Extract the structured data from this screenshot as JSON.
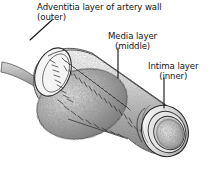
{
  "figure": {
    "style": "black-and-white stippled line drawing",
    "colors": {
      "background": "#ffffff",
      "ink": "#151515",
      "outline": "#2a2a2a",
      "shading_dark": "#6f6f6f",
      "shading_mid": "#9a9a9a",
      "shading_light": "#cfcfcf"
    },
    "labels": [
      {
        "id": "adventitia",
        "line1": "Adventitia layer of artery wall",
        "line2": "(outer)",
        "leader": "diagonal line from text down-left crossing the outer tube wall"
      },
      {
        "id": "media",
        "line1": "Media layer",
        "line2": "(middle)",
        "leader": "vertical line from text down to the middle layer of the tube"
      },
      {
        "id": "intima",
        "line1": "Intima layer",
        "line2": "(inner)",
        "leader": "vertical line from text down to the inner lining at the cut end"
      }
    ],
    "parts": [
      "adventitia (outer layer)",
      "media (middle layer)",
      "intima (inner layer)",
      "lumen (open channel at cut end)",
      "bulge / swollen segment at left",
      "small branch vessel at far left"
    ]
  }
}
